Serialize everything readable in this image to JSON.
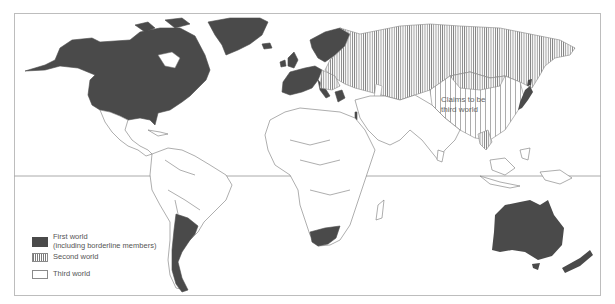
{
  "map": {
    "type": "world political map",
    "projection_lines": [
      "equator"
    ],
    "colors": {
      "first_world": "#4a4a4a",
      "second_world_hatch": "#7a7a7a",
      "third_world": "#ffffff",
      "borders": "#777777",
      "frame": "#bdbdbd"
    },
    "annotation": {
      "line1": "Claims to be",
      "line2": "third world",
      "region": "China"
    },
    "regions": {
      "first_world": [
        "Canada",
        "United States",
        "Greenland",
        "Western Europe",
        "Scandinavia",
        "Japan",
        "Australia",
        "New Zealand",
        "South Africa",
        "Argentina",
        "Israel",
        "Greece"
      ],
      "second_world": [
        "Soviet Union",
        "Eastern Europe",
        "Mongolia",
        "China (hatched wide)",
        "Vietnam/Laos"
      ],
      "third_world": [
        "Latin America",
        "Africa",
        "Middle East",
        "South Asia",
        "Southeast Asia"
      ]
    }
  },
  "legend": {
    "items": [
      {
        "label_line1": "First world",
        "label_line2": "(including borderline members)",
        "swatch": "solid-dark"
      },
      {
        "label_line1": "Second world",
        "swatch": "vertical-hatch"
      },
      {
        "label_line1": "Third world",
        "swatch": "white"
      }
    ]
  }
}
